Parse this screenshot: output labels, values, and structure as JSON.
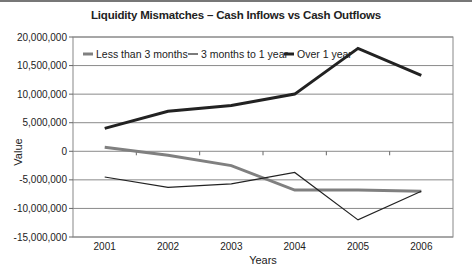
{
  "chart_data": {
    "type": "line",
    "title": "Liquidity Mismatches – Cash Inflows vs Cash Outflows",
    "xlabel": "Years",
    "ylabel": "Value",
    "categories": [
      "2001",
      "2002",
      "2003",
      "2004",
      "2005",
      "2006"
    ],
    "y_tick_labels": [
      "20,000,000",
      "10,500,000",
      "10,000,000",
      "5,000,000",
      "0",
      "-5,000,000",
      "-10,000,000",
      "-15,000,000"
    ],
    "ylim": [
      -15000000,
      20000000
    ],
    "grid": true,
    "legend_position": "top-inside",
    "series": [
      {
        "name": "Less than 3 months",
        "color": "#808080",
        "width": 3,
        "values": [
          700000,
          -700000,
          -2500000,
          -6800000,
          -6800000,
          -7000000
        ]
      },
      {
        "name": "3 months to 1 year",
        "color": "#222222",
        "width": 1.2,
        "values": [
          -4500000,
          -6300000,
          -5700000,
          -3700000,
          -12000000,
          -7000000
        ]
      },
      {
        "name": "Over 1 year",
        "color": "#222222",
        "width": 3,
        "values": [
          4000000,
          7000000,
          8000000,
          10000000,
          18000000,
          13300000
        ]
      }
    ]
  }
}
